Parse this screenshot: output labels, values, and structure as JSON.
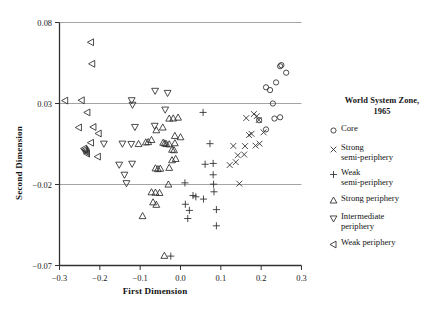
{
  "chart_data": {
    "type": "scatter",
    "title": "",
    "xlabel": "First Dimension",
    "ylabel": "Second Dimension",
    "xlim": [
      -0.3,
      0.3
    ],
    "ylim": [
      -0.07,
      0.08
    ],
    "xticks": [
      -0.3,
      -0.2,
      -0.1,
      0.0,
      0.1,
      0.2,
      0.3
    ],
    "xtick_labels": [
      "−0.3",
      "−0.2",
      "−0.1",
      "0.0",
      "0.1",
      "0.2",
      "0.3"
    ],
    "yticks": [
      0.08,
      0.03,
      -0.02,
      -0.07
    ],
    "ytick_labels": [
      "0.08",
      "0.03",
      "−0.02",
      "−0.07"
    ],
    "gridlines_y": [
      0.08,
      0.03,
      -0.02
    ],
    "grid": true,
    "legend_position": "right",
    "legend_title": "World System Zone, 1965",
    "series": [
      {
        "name": "Core",
        "marker": "circle",
        "points": [
          [
            0.212,
            0.04
          ],
          [
            0.222,
            0.0383
          ],
          [
            0.237,
            0.043
          ],
          [
            0.247,
            0.053
          ],
          [
            0.25,
            0.0537
          ],
          [
            0.262,
            0.049
          ],
          [
            0.229,
            0.03
          ],
          [
            0.233,
            0.0207
          ],
          [
            0.247,
            0.0215
          ],
          [
            0.195,
            0.0197
          ],
          [
            0.212,
            0.014
          ]
        ]
      },
      {
        "name": "Strong semi-periphery",
        "marker": "x",
        "points": [
          [
            0.163,
            0.021
          ],
          [
            0.182,
            0.0235
          ],
          [
            0.189,
            0.0222
          ],
          [
            0.194,
            0.0198
          ],
          [
            0.17,
            0.0105
          ],
          [
            0.176,
            0.0113
          ],
          [
            0.206,
            0.0122
          ],
          [
            0.16,
            0.0037
          ],
          [
            0.186,
            0.004
          ],
          [
            0.196,
            0.0052
          ],
          [
            0.131,
            0.0038
          ],
          [
            0.142,
            -0.002
          ],
          [
            0.158,
            -0.0015
          ],
          [
            0.122,
            -0.008
          ],
          [
            0.137,
            -0.0062
          ],
          [
            0.146,
            -0.0195
          ]
        ]
      },
      {
        "name": "Weak semi-periphery",
        "marker": "plus",
        "points": [
          [
            0.056,
            0.0245
          ],
          [
            0.073,
            0.0052
          ],
          [
            0.061,
            -0.0075
          ],
          [
            0.081,
            -0.007
          ],
          [
            0.081,
            -0.014
          ],
          [
            0.011,
            -0.019
          ],
          [
            0.082,
            -0.0198
          ],
          [
            0.083,
            -0.0245
          ],
          [
            0.031,
            -0.0268
          ],
          [
            0.038,
            -0.0276
          ],
          [
            0.057,
            -0.029
          ],
          [
            0.012,
            -0.0322
          ],
          [
            0.022,
            -0.036
          ],
          [
            0.089,
            -0.0355
          ],
          [
            0.018,
            -0.041
          ],
          [
            0.089,
            -0.0455
          ],
          [
            -0.024,
            -0.0642
          ]
        ]
      },
      {
        "name": "Strong periphery",
        "marker": "triangle-up",
        "points": [
          [
            -0.028,
            0.0207
          ],
          [
            -0.018,
            0.0208
          ],
          [
            -0.006,
            0.0213
          ],
          [
            -0.044,
            0.0152
          ],
          [
            -0.06,
            0.0135
          ],
          [
            -0.014,
            0.01
          ],
          [
            -0.043,
            0.0058
          ],
          [
            -0.039,
            0.0054
          ],
          [
            -0.035,
            0.005
          ],
          [
            -0.028,
            0.0048
          ],
          [
            -0.014,
            0.0055
          ],
          [
            0.0,
            0.0092
          ],
          [
            -0.021,
            0.0015
          ],
          [
            -0.016,
            0.0012
          ],
          [
            -0.104,
            0.005
          ],
          [
            -0.086,
            0.006
          ],
          [
            -0.08,
            0.0062
          ],
          [
            -0.072,
            0.0075
          ],
          [
            -0.021,
            -0.005
          ],
          [
            -0.012,
            -0.0042
          ],
          [
            -0.028,
            -0.0097
          ],
          [
            -0.062,
            -0.01
          ],
          [
            -0.056,
            -0.0105
          ],
          [
            -0.05,
            -0.0102
          ],
          [
            -0.03,
            -0.02
          ],
          [
            -0.072,
            -0.0248
          ],
          [
            -0.062,
            -0.025
          ],
          [
            -0.052,
            -0.0252
          ],
          [
            -0.068,
            -0.031
          ],
          [
            -0.06,
            -0.0325
          ],
          [
            -0.094,
            -0.0395
          ],
          [
            -0.04,
            -0.064
          ]
        ]
      },
      {
        "name": "Intermediate periphery",
        "marker": "triangle-down",
        "points": [
          [
            -0.063,
            0.0378
          ],
          [
            -0.032,
            0.0365
          ],
          [
            -0.121,
            0.032
          ],
          [
            -0.119,
            0.0292
          ],
          [
            -0.038,
            0.0262
          ],
          [
            -0.113,
            0.0155
          ],
          [
            -0.064,
            0.0162
          ],
          [
            -0.144,
            0.0052
          ],
          [
            -0.122,
            0.005
          ],
          [
            -0.19,
            0.0052
          ],
          [
            -0.12,
            -0.0072
          ],
          [
            -0.152,
            -0.0078
          ],
          [
            -0.139,
            -0.014
          ],
          [
            -0.134,
            -0.0192
          ]
        ]
      },
      {
        "name": "Weak periphery",
        "marker": "triangle-left",
        "points": [
          [
            -0.222,
            0.0678
          ],
          [
            -0.219,
            0.0545
          ],
          [
            -0.286,
            0.0318
          ],
          [
            -0.245,
            0.032
          ],
          [
            -0.231,
            0.0245
          ],
          [
            -0.252,
            0.0152
          ],
          [
            -0.216,
            0.0155
          ],
          [
            -0.203,
            0.0115
          ],
          [
            -0.222,
            0.0058
          ],
          [
            -0.239,
            0.0022
          ],
          [
            -0.237,
            0.0015
          ],
          [
            -0.235,
            0.0008
          ],
          [
            -0.233,
            0.0
          ],
          [
            -0.232,
            -0.001
          ],
          [
            -0.205,
            -0.0028
          ]
        ]
      }
    ]
  },
  "legend": {
    "title_line1": "World System Zone,",
    "title_line2": "1965",
    "items": [
      {
        "label": "Core",
        "marker": "circle"
      },
      {
        "label": "Strong\nsemi-periphery",
        "marker": "x"
      },
      {
        "label": "Weak\nsemi-periphery",
        "marker": "plus"
      },
      {
        "label": "Strong periphery",
        "marker": "triangle-up"
      },
      {
        "label": "Intermediate\nperiphery",
        "marker": "triangle-down"
      },
      {
        "label": "Weak periphery",
        "marker": "triangle-left"
      }
    ]
  },
  "axes": {
    "x_title": "First Dimension",
    "y_title": "Second Dimension"
  },
  "colors": {
    "marker": "#2b2b2b",
    "axis": "#333333",
    "grid": "#9a9a9a",
    "text": "#141414",
    "background": "#ffffff"
  }
}
